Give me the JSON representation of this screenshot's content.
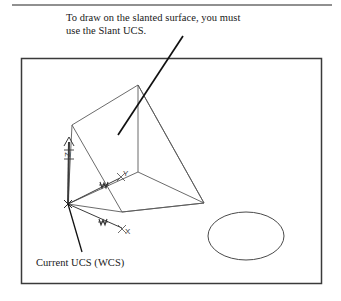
{
  "figure": {
    "caption": "To draw on the slanted surface, you must\nuse the Slant UCS.",
    "ucs_label": "Current UCS (WCS)",
    "colors": {
      "ink": "#1a1a1a",
      "line": "#555555",
      "frame": "#3a3a3a",
      "rule": "#666666",
      "background": "#ffffff"
    },
    "annotations": {
      "z_axis_label": "Z",
      "y_axis_label": "Y",
      "x_axis_label": "X",
      "wcs_marker_upper": "W",
      "wcs_marker_lower": "W"
    },
    "shapes": {
      "frame": {
        "x": 21,
        "y": 58,
        "width": 301,
        "height": 226
      },
      "top_rule": {
        "x1": 12,
        "y1": 5,
        "x2": 332,
        "y2": 5
      },
      "wedge_note": "isometric wedge with slanted front face",
      "ellipse": {
        "cx": 246,
        "cy": 236,
        "rx": 38,
        "ry": 24
      },
      "caption_leader": {
        "x1": 183,
        "y1": 36,
        "x2": 118,
        "y2": 135
      },
      "ucs_leader": {
        "x1": 68,
        "y1": 204,
        "x2": 82,
        "y2": 252
      }
    }
  }
}
